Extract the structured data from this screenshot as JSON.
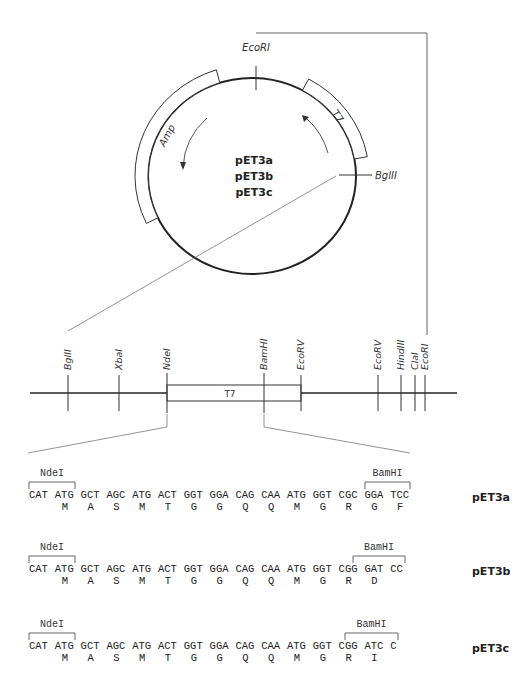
{
  "plasmid": {
    "names": [
      "pET3a",
      "pET3b",
      "pET3c"
    ],
    "features": [
      {
        "label": "Amp",
        "type": "gene",
        "direction": "counterclockwise"
      },
      {
        "label": "T7",
        "type": "promoter",
        "direction": "counterclockwise"
      }
    ],
    "sites": [
      {
        "label": "EcoRI"
      },
      {
        "label": "BglII"
      }
    ]
  },
  "linear_map": {
    "sites": [
      {
        "label": "BglII",
        "x": 68
      },
      {
        "label": "XbaI",
        "x": 119
      },
      {
        "label": "NdeI",
        "x": 167
      },
      {
        "label": "BamHI",
        "x": 264
      },
      {
        "label": "EcoRV",
        "x": 301
      },
      {
        "label": "EcoRV",
        "x": 378
      },
      {
        "label": "HindIII",
        "x": 401
      },
      {
        "label": "ClaI",
        "x": 415
      },
      {
        "label": "EcoRI",
        "x": 425
      }
    ],
    "box_label": "T7"
  },
  "sequences": [
    {
      "name": "pET3a",
      "left_site": "NdeI",
      "right_site": "BamHI",
      "codons": [
        "CAT",
        "ATG",
        "GCT",
        "AGC",
        "ATG",
        "ACT",
        "GGT",
        "GGA",
        "CAG",
        "CAA",
        "ATG",
        "GGT",
        "CGC",
        "GGA",
        "TCC"
      ],
      "amino_acids": [
        "",
        "M",
        "A",
        "S",
        "M",
        "T",
        "G",
        "G",
        "Q",
        "Q",
        "M",
        "G",
        "R",
        "G",
        "F"
      ]
    },
    {
      "name": "pET3b",
      "left_site": "NdeI",
      "right_site": "BamHI",
      "codons": [
        "CAT",
        "ATG",
        "GCT",
        "AGC",
        "ATG",
        "ACT",
        "GGT",
        "GGA",
        "CAG",
        "CAA",
        "ATG",
        "GGT",
        "CGG",
        "GAT",
        "CC"
      ],
      "amino_acids": [
        "",
        "M",
        "A",
        "S",
        "M",
        "T",
        "G",
        "G",
        "Q",
        "Q",
        "M",
        "G",
        "R",
        "D",
        ""
      ]
    },
    {
      "name": "pET3c",
      "left_site": "NdeI",
      "right_site": "BamHI",
      "codons": [
        "CAT",
        "ATG",
        "GCT",
        "AGC",
        "ATG",
        "ACT",
        "GGT",
        "GGA",
        "CAG",
        "CAA",
        "ATG",
        "GGT",
        "CGG",
        "ATC",
        "C"
      ],
      "amino_acids": [
        "",
        "M",
        "A",
        "S",
        "M",
        "T",
        "G",
        "G",
        "Q",
        "Q",
        "M",
        "G",
        "R",
        "I",
        ""
      ]
    }
  ]
}
